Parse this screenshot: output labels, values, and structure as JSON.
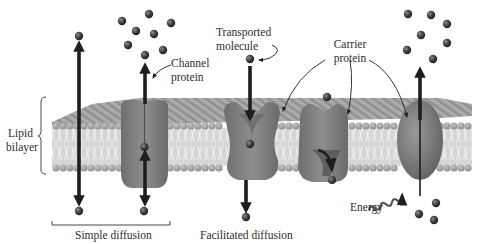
{
  "diagram": {
    "labels": {
      "lipid_bilayer_line1": "Lipid",
      "lipid_bilayer_line2": "bilayer",
      "channel_protein_line1": "Channel",
      "channel_protein_line2": "protein",
      "transported_molecule_line1": "Transported",
      "transported_molecule_line2": "molecule",
      "carrier_protein_line1": "Carrier",
      "carrier_protein_line2": "protein",
      "energy": "Energy",
      "simple_diffusion": "Simple diffusion",
      "facilitated_diffusion": "Facilitated diffusion"
    },
    "components": [
      {
        "id": "lipid-bilayer",
        "kind": "membrane"
      },
      {
        "id": "direct-diffusion",
        "kind": "arrow",
        "direction": "bidirectional",
        "group": "simple_diffusion"
      },
      {
        "id": "channel-protein",
        "kind": "protein",
        "direction": "bidirectional",
        "group": "simple_diffusion"
      },
      {
        "id": "carrier-protein-1",
        "kind": "protein",
        "direction": "down",
        "group": "facilitated_diffusion"
      },
      {
        "id": "carrier-protein-2",
        "kind": "protein",
        "direction": "down",
        "group": "facilitated_diffusion"
      },
      {
        "id": "active-pump",
        "kind": "protein",
        "direction": "up",
        "powered_by": "energy"
      }
    ],
    "colors": {
      "background": "#ffffff",
      "membrane_head": "#9a9a9a",
      "membrane_top": "#8c8c8c",
      "membrane_tail": "#c8c8c8",
      "protein": "#7d7d7d",
      "protein_dark": "#5a5a5a",
      "molecule": "#3c3c3c",
      "arrow": "#1e1e1e",
      "text": "#2e2e2e"
    }
  }
}
